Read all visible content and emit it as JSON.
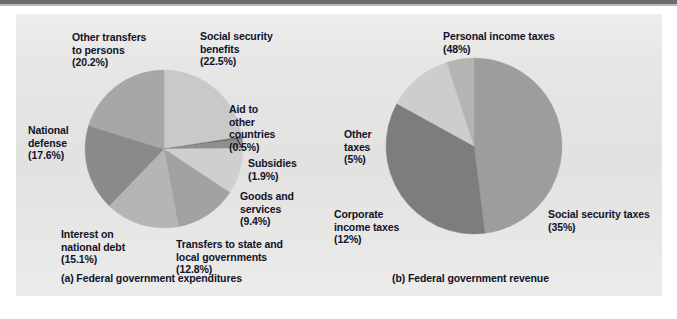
{
  "figure": {
    "background_color": "#e6e6e4",
    "page_color": "#ffffff",
    "text_color": "#12122a"
  },
  "captions": {
    "left": "(a) Federal government expenditures",
    "right": "(b) Federal government revenue"
  },
  "chart_data": [
    {
      "type": "pie",
      "id": "federal-government-expenditures",
      "title": "(a) Federal government expenditures",
      "legend": "labels-outside-with-leader-lines",
      "grid": false,
      "total_percent": 100.0,
      "start_angle_deg": 0,
      "direction": "clockwise",
      "center": [
        164,
        149
      ],
      "radius": 79,
      "categories": [
        "Social security benefits",
        "Aid to other countries",
        "Subsidies",
        "Goods and services",
        "Transfers to state and local governments",
        "Interest on national debt",
        "National defense",
        "Other transfers to persons"
      ],
      "values": [
        22.5,
        0.5,
        1.9,
        9.4,
        12.8,
        15.1,
        17.6,
        20.2
      ],
      "value_labels": [
        "(22.5%)",
        "(0.5%)",
        "(1.9%)",
        "(9.4%)",
        "(12.8%)",
        "(15.1%)",
        "(17.6%)",
        "(20.2%)"
      ],
      "colors": [
        "#c9c9c7",
        "#6f6f6f",
        "#8e8e8c",
        "#cfcfcd",
        "#a2a2a0",
        "#b5b5b3",
        "#8a8a88",
        "#a7a7a5"
      ],
      "labels": [
        {
          "name": "social-security-benefits",
          "line1": "Social security",
          "line2": "benefits",
          "line3": "(22.5%)",
          "line4": "",
          "x": 200,
          "y": 30,
          "align": "left"
        },
        {
          "name": "aid-to-other-countries",
          "line1": "Aid to",
          "line2": "other",
          "line3": "countries",
          "line4": "(0.5%)",
          "x": 229,
          "y": 103,
          "align": "left"
        },
        {
          "name": "subsidies",
          "line1": "Subsidies",
          "line2": "(1.9%)",
          "line3": "",
          "line4": "",
          "x": 248,
          "y": 157,
          "align": "left"
        },
        {
          "name": "goods-and-services",
          "line1": "Goods and",
          "line2": "services",
          "line3": "(9.4%)",
          "line4": "",
          "x": 240,
          "y": 190,
          "align": "left"
        },
        {
          "name": "transfers-to-state-and-local-governments",
          "line1": "Transfers to state and",
          "line2": "local governments",
          "line3": "(12.8%)",
          "line4": "",
          "x": 176,
          "y": 238,
          "align": "left"
        },
        {
          "name": "interest-on-national-debt",
          "line1": "Interest on",
          "line2": "national debt",
          "line3": "(15.1%)",
          "line4": "",
          "x": 61,
          "y": 228,
          "align": "left"
        },
        {
          "name": "national-defense",
          "line1": "National",
          "line2": "defense",
          "line3": "(17.6%)",
          "line4": "",
          "x": 28,
          "y": 124,
          "align": "left"
        },
        {
          "name": "other-transfers-to-persons",
          "line1": "Other transfers",
          "line2": "to persons",
          "line3": "(20.2%)",
          "line4": "",
          "x": 72,
          "y": 31,
          "align": "left"
        }
      ]
    },
    {
      "type": "pie",
      "id": "federal-government-revenue",
      "title": "(b) Federal government revenue",
      "legend": "labels-outside",
      "grid": false,
      "total_percent": 100.0,
      "start_angle_deg": 0,
      "direction": "clockwise",
      "center": [
        474,
        146
      ],
      "radius": 88,
      "categories": [
        "Personal income taxes",
        "Social security taxes",
        "Corporate income taxes",
        "Other taxes"
      ],
      "values": [
        48,
        35,
        12,
        5
      ],
      "value_labels": [
        "(48%)",
        "(35%)",
        "(12%)",
        "(5%)"
      ],
      "colors": [
        "#9d9d9b",
        "#7d7d7b",
        "#cdcdcb",
        "#b4b4b2"
      ],
      "labels": [
        {
          "name": "personal-income-taxes",
          "line1": "Personal income taxes",
          "line2": "(48%)",
          "line3": "",
          "line4": "",
          "x": 443,
          "y": 30,
          "align": "left"
        },
        {
          "name": "social-security-taxes",
          "line1": "Social security taxes",
          "line2": "(35%)",
          "line3": "",
          "line4": "",
          "x": 548,
          "y": 208,
          "align": "left"
        },
        {
          "name": "corporate-income-taxes",
          "line1": "Corporate",
          "line2": "income taxes",
          "line3": "(12%)",
          "line4": "",
          "x": 334,
          "y": 208,
          "align": "left"
        },
        {
          "name": "other-taxes",
          "line1": "Other",
          "line2": "taxes",
          "line3": "(5%)",
          "line4": "",
          "x": 344,
          "y": 128,
          "align": "left"
        }
      ]
    }
  ]
}
